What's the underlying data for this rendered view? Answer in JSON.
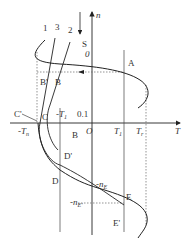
{
  "diagram": {
    "axes": {
      "vertical_label": "n",
      "horizontal_label": "T",
      "origin_label": "O"
    },
    "curve_labels": [
      "1",
      "3",
      "2"
    ],
    "direction_label": "S",
    "points": {
      "zero": "0",
      "A": "A",
      "B_prime": "B'",
      "B": "B",
      "C_prime": "C'",
      "C": "C",
      "D_prime": "D'",
      "D": "D",
      "E": "E",
      "E_prime": "E'"
    },
    "region_label": "B",
    "tick_labels": {
      "neg_Tn": "-T",
      "neg_Tn_sub": "n",
      "neg_T1": "-T",
      "neg_T1_sub": "1",
      "point_one": "0.1",
      "T1": "T",
      "T1_sub": "1",
      "Tr": "T",
      "Tr_sub": "r"
    },
    "speed_labels": {
      "neg_nE": "-n",
      "neg_nE_sub": "E",
      "neg_nE_prime": "-n",
      "neg_nE_prime_sub": "E'"
    },
    "colors": {
      "line": "#222222",
      "dotted": "#555555",
      "background": "#ffffff"
    }
  }
}
